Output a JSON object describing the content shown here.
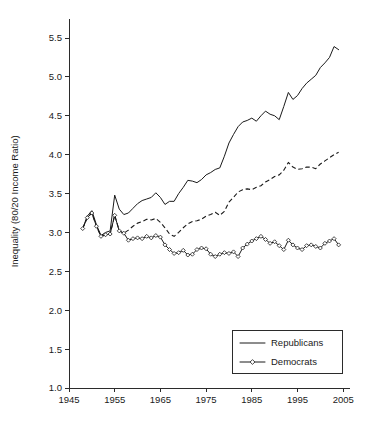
{
  "chart_data": {
    "type": "line",
    "title": "",
    "xlabel": "",
    "ylabel": "Inequality (80/20 Income Ratio)",
    "xlim": [
      1945,
      2006
    ],
    "ylim": [
      1.0,
      5.75
    ],
    "xticks": [
      1945,
      1955,
      1965,
      1975,
      1985,
      1995,
      2005
    ],
    "xticklabels": [
      "1945",
      "1955",
      "1965",
      "1975",
      "1985",
      "1995",
      "2005"
    ],
    "yticks": [
      1.0,
      1.5,
      2.0,
      2.5,
      3.0,
      3.5,
      4.0,
      4.5,
      5.0,
      5.5
    ],
    "yticklabels": [
      "1.0",
      "1.5",
      "2.0",
      "2.5",
      "3.0",
      "3.5",
      "4.0",
      "4.5",
      "5.0",
      "5.5"
    ],
    "grid": false,
    "legend_position": "lower right",
    "series": [
      {
        "name": "Republicans",
        "style": "solid",
        "marker": "none",
        "x": [
          1948,
          1949,
          1950,
          1951,
          1952,
          1953,
          1954,
          1955,
          1956,
          1957,
          1958,
          1959,
          1960,
          1961,
          1962,
          1963,
          1964,
          1965,
          1966,
          1967,
          1968,
          1969,
          1970,
          1971,
          1972,
          1973,
          1974,
          1975,
          1976,
          1977,
          1978,
          1979,
          1980,
          1981,
          1982,
          1983,
          1984,
          1985,
          1986,
          1987,
          1988,
          1989,
          1990,
          1991,
          1992,
          1993,
          1994,
          1995,
          1996,
          1997,
          1998,
          1999,
          2000,
          2001,
          2002,
          2003,
          2004
        ],
        "values": [
          3.05,
          3.21,
          3.28,
          3.1,
          2.96,
          3.0,
          3.02,
          3.48,
          3.3,
          3.23,
          3.25,
          3.31,
          3.37,
          3.41,
          3.43,
          3.45,
          3.51,
          3.45,
          3.36,
          3.4,
          3.4,
          3.5,
          3.58,
          3.67,
          3.66,
          3.64,
          3.68,
          3.74,
          3.77,
          3.81,
          3.83,
          3.98,
          4.15,
          4.26,
          4.36,
          4.42,
          4.44,
          4.47,
          4.43,
          4.5,
          4.56,
          4.52,
          4.5,
          4.45,
          4.62,
          4.8,
          4.71,
          4.76,
          4.85,
          4.92,
          4.97,
          5.02,
          5.12,
          5.18,
          5.25,
          5.39,
          5.35
        ]
      },
      {
        "name": "Democrats",
        "style": "dashed",
        "marker": "none",
        "x": [
          1948,
          1949,
          1950,
          1951,
          1952,
          1953,
          1954,
          1955,
          1956,
          1957,
          1958,
          1959,
          1960,
          1961,
          1962,
          1963,
          1964,
          1965,
          1966,
          1967,
          1968,
          1969,
          1970,
          1971,
          1972,
          1973,
          1974,
          1975,
          1976,
          1977,
          1978,
          1979,
          1980,
          1981,
          1982,
          1983,
          1984,
          1985,
          1986,
          1987,
          1988,
          1989,
          1990,
          1991,
          1992,
          1993,
          1994,
          1995,
          1996,
          1997,
          1998,
          1999,
          2000,
          2001,
          2002,
          2003,
          2004
        ],
        "values": [
          3.05,
          3.19,
          3.25,
          3.08,
          2.95,
          2.97,
          2.98,
          3.22,
          3.02,
          2.99,
          3.03,
          3.08,
          3.12,
          3.14,
          3.17,
          3.16,
          3.18,
          3.13,
          3.06,
          2.98,
          2.95,
          3.0,
          3.06,
          3.11,
          3.14,
          3.15,
          3.17,
          3.21,
          3.23,
          3.26,
          3.22,
          3.27,
          3.39,
          3.45,
          3.52,
          3.55,
          3.56,
          3.55,
          3.58,
          3.6,
          3.65,
          3.68,
          3.72,
          3.74,
          3.8,
          3.9,
          3.84,
          3.81,
          3.82,
          3.84,
          3.84,
          3.82,
          3.88,
          3.92,
          3.96,
          4.0,
          4.03
        ]
      },
      {
        "name": "Democrats-markers",
        "style": "solid-thin",
        "marker": "diamond",
        "x": [
          1948,
          1949,
          1950,
          1951,
          1952,
          1953,
          1954,
          1955,
          1956,
          1957,
          1958,
          1959,
          1960,
          1961,
          1962,
          1963,
          1964,
          1965,
          1966,
          1967,
          1968,
          1969,
          1970,
          1971,
          1972,
          1973,
          1974,
          1975,
          1976,
          1977,
          1978,
          1979,
          1980,
          1981,
          1982,
          1983,
          1984,
          1985,
          1986,
          1987,
          1988,
          1989,
          1990,
          1991,
          1992,
          1993,
          1994,
          1995,
          1996,
          1997,
          1998,
          1999,
          2000,
          2001,
          2002,
          2003,
          2004
        ],
        "values": [
          3.05,
          3.19,
          3.25,
          3.08,
          2.95,
          2.97,
          2.98,
          3.22,
          3.02,
          2.99,
          2.9,
          2.92,
          2.93,
          2.92,
          2.95,
          2.93,
          2.96,
          2.94,
          2.84,
          2.78,
          2.73,
          2.74,
          2.77,
          2.71,
          2.72,
          2.78,
          2.8,
          2.79,
          2.72,
          2.69,
          2.72,
          2.74,
          2.73,
          2.75,
          2.69,
          2.8,
          2.85,
          2.89,
          2.92,
          2.95,
          2.91,
          2.86,
          2.88,
          2.83,
          2.78,
          2.9,
          2.84,
          2.8,
          2.78,
          2.83,
          2.84,
          2.82,
          2.8,
          2.86,
          2.89,
          2.92,
          2.84
        ]
      }
    ]
  },
  "legend": {
    "items": [
      {
        "label": "Republicans",
        "style": "solid",
        "marker": "none"
      },
      {
        "label": "Democrats",
        "style": "solid",
        "marker": "diamond"
      }
    ]
  },
  "colors": {
    "ink": "#1a1a1a",
    "axis": "#2b2b2b",
    "background": "#ffffff"
  }
}
